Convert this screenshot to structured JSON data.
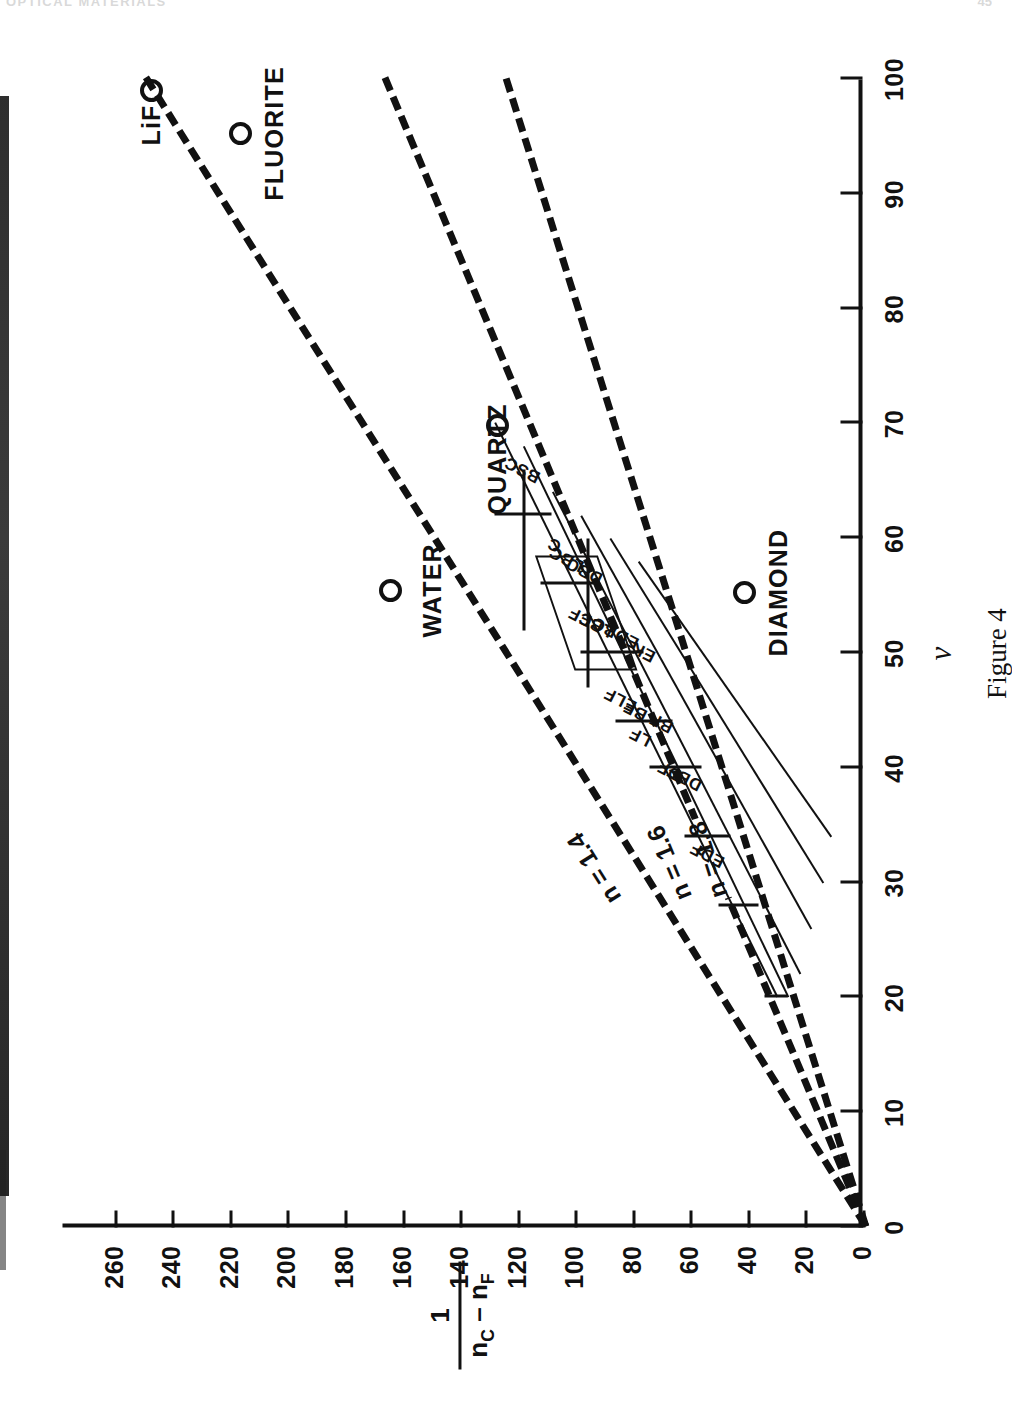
{
  "page": {
    "header_left": "OPTICAL MATERIALS",
    "header_right": "45",
    "caption": "Figure 4"
  },
  "chart_data": {
    "type": "scatter",
    "title": "Figure 4",
    "xlabel": "ν",
    "ylabel_numerator": "1",
    "ylabel_denominator_nc": "n",
    "ylabel_denominator_nc_sub": "C",
    "ylabel_denominator_minus": "–",
    "ylabel_denominator_nf": "n",
    "ylabel_denominator_nf_sub": "F",
    "xlim": [
      0,
      100
    ],
    "ylim": [
      0,
      278
    ],
    "x_tick_step": 10,
    "y_tick_step": 20,
    "grid": false,
    "xticks": [
      "0",
      "10",
      "20",
      "30",
      "40",
      "50",
      "60",
      "70",
      "80",
      "90",
      "100"
    ],
    "yticks": [
      "0",
      "20",
      "40",
      "60",
      "80",
      "100",
      "120",
      "140",
      "160",
      "180",
      "200",
      "220",
      "240",
      "260"
    ],
    "iso_lines": [
      {
        "label": "n = 1.4",
        "n": 1.4,
        "x0": 0,
        "y0": 0,
        "x1": 100,
        "y1": 250,
        "label_at_x": 33
      },
      {
        "label": "n = 1.6",
        "n": 1.6,
        "x0": 0,
        "y0": 0,
        "x1": 100,
        "y1": 167,
        "label_at_x": 33
      },
      {
        "label": "n = 1.8",
        "n": 1.8,
        "x0": 0,
        "y0": 0,
        "x1": 100,
        "y1": 125,
        "label_at_x": 33
      }
    ],
    "materials": [
      {
        "name": "LiF",
        "x": 99.0,
        "y": 247.0,
        "label_side": "left"
      },
      {
        "name": "FLUORITE",
        "x": 95.3,
        "y": 216.0,
        "label_side": "right"
      },
      {
        "name": "QUARTZ",
        "x": 69.9,
        "y": 127.0,
        "label_side": "left"
      },
      {
        "name": "WATER",
        "x": 55.5,
        "y": 164.0,
        "label_side": "below"
      },
      {
        "name": "DIAMOND",
        "x": 55.3,
        "y": 41.0,
        "label_side": "right"
      }
    ],
    "glass_types": [
      {
        "code": "BSC",
        "x": 66.0,
        "y": 118.0
      },
      {
        "code": "C",
        "x": 59.5,
        "y": 107.0
      },
      {
        "code": "LBC",
        "x": 58.3,
        "y": 103.0
      },
      {
        "code": "DBC",
        "x": 57.2,
        "y": 96.5
      },
      {
        "code": "CF",
        "x": 53.2,
        "y": 98.0
      },
      {
        "code": "LBF",
        "x": 52.5,
        "y": 92.5
      },
      {
        "code": "EDBC",
        "x": 51.8,
        "y": 86.0
      },
      {
        "code": "EK",
        "x": 50.2,
        "y": 76.0
      },
      {
        "code": "ELF",
        "x": 46.0,
        "y": 84.0
      },
      {
        "code": "BF",
        "x": 45.0,
        "y": 79.0
      },
      {
        "code": "BF",
        "x": 44.0,
        "y": 70.0
      },
      {
        "code": "LF",
        "x": 42.8,
        "y": 77.0
      },
      {
        "code": "DF",
        "x": 39.8,
        "y": 67.0
      },
      {
        "code": "DBF",
        "x": 39.2,
        "y": 62.0
      },
      {
        "code": "EDF",
        "x": 32.5,
        "y": 54.0
      }
    ]
  }
}
